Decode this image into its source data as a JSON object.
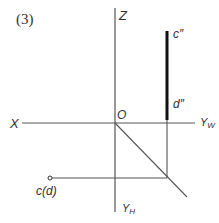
{
  "figure": {
    "number_label": "(3)",
    "axes": {
      "z_label": "Z",
      "x_label": "X",
      "yw_label": "Y",
      "yw_sub": "W",
      "yh_label": "Y",
      "yh_sub": "H",
      "origin_label": "O"
    },
    "points": {
      "c_pp_label": "c″",
      "d_pp_label": "d″",
      "cd_label": "c(d)"
    },
    "colors": {
      "line": "#444444",
      "thick_line": "#111111",
      "text": "#333333"
    }
  }
}
